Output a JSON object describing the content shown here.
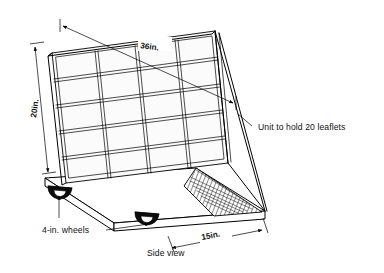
{
  "drawing": {
    "title": "Leaflet display unit side view",
    "background_color": "#ffffff",
    "line_color": "#000000",
    "annotations": {
      "width_dim": "36in.",
      "height_dim": "20in.",
      "depth_dim": "15in.",
      "capacity_note": "Unit to hold 20 leaflets",
      "wheels_note": "4-in. wheels",
      "view_note": "Side view"
    },
    "rack": {
      "rows": 5,
      "columns": 4,
      "pockets_total": 20
    },
    "wheels": {
      "count": 2,
      "diameter_label": "4-in."
    },
    "icons": {
      "arrowhead": "arrowhead-icon",
      "wheel": "caster-wheel-icon",
      "hatch": "hatched-base-panel-icon"
    }
  }
}
